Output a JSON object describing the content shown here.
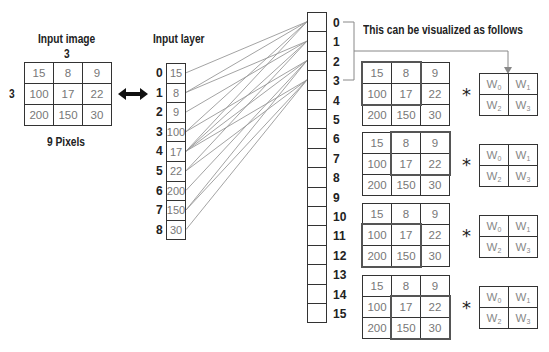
{
  "input_image": {
    "title": "Input image",
    "width_label": "3",
    "height_label": "3",
    "caption": "9 Pixels",
    "pixels": [
      [
        15,
        8,
        9
      ],
      [
        100,
        17,
        22
      ],
      [
        200,
        150,
        30
      ]
    ]
  },
  "input_layer": {
    "title": "Input layer",
    "nodes": [
      {
        "index": "0",
        "value": "15"
      },
      {
        "index": "1",
        "value": "8"
      },
      {
        "index": "2",
        "value": "9"
      },
      {
        "index": "3",
        "value": "100"
      },
      {
        "index": "4",
        "value": "17"
      },
      {
        "index": "5",
        "value": "22"
      },
      {
        "index": "6",
        "value": "200"
      },
      {
        "index": "7",
        "value": "150"
      },
      {
        "index": "8",
        "value": "30"
      }
    ]
  },
  "hidden_layer": {
    "indices": [
      "0",
      "1",
      "2",
      "3",
      "4",
      "5",
      "6",
      "7",
      "8",
      "9",
      "10",
      "11",
      "12",
      "13",
      "14",
      "15"
    ]
  },
  "connections": [
    {
      "from": 0,
      "to": 0
    },
    {
      "from": 1,
      "to": 0
    },
    {
      "from": 3,
      "to": 0
    },
    {
      "from": 4,
      "to": 0
    },
    {
      "from": 1,
      "to": 1
    },
    {
      "from": 2,
      "to": 1
    },
    {
      "from": 4,
      "to": 1
    },
    {
      "from": 5,
      "to": 1
    },
    {
      "from": 3,
      "to": 2
    },
    {
      "from": 4,
      "to": 2
    },
    {
      "from": 6,
      "to": 2
    },
    {
      "from": 7,
      "to": 2
    },
    {
      "from": 4,
      "to": 3
    },
    {
      "from": 5,
      "to": 3
    },
    {
      "from": 7,
      "to": 3
    },
    {
      "from": 8,
      "to": 3
    }
  ],
  "visualization": {
    "caption": "This can be visualized as follows",
    "operator": "*",
    "windows": [
      {
        "row": 0,
        "col": 0
      },
      {
        "row": 0,
        "col": 1
      },
      {
        "row": 1,
        "col": 0
      },
      {
        "row": 1,
        "col": 1
      }
    ],
    "weights": [
      [
        "W",
        "0"
      ],
      [
        "W",
        "1"
      ],
      [
        "W",
        "2"
      ],
      [
        "W",
        "3"
      ]
    ]
  }
}
